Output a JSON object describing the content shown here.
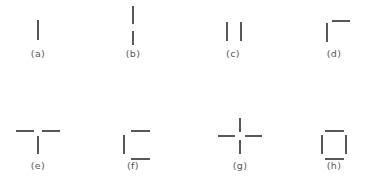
{
  "page": {
    "background_color": "#ffffff",
    "stroke_color": "#55585c",
    "label_color": "#55585c",
    "width": 366,
    "height": 185,
    "rows": 2,
    "columns": 4
  },
  "figures": [
    {
      "id": "a",
      "label": "(a)",
      "description": "single vertical stroke",
      "stroke_count": 1,
      "anchor": {
        "x": 38,
        "y": 20
      },
      "label_pos": {
        "x": 38,
        "y": 48
      },
      "strokes": [
        {
          "name": "vertical-stroke",
          "orientation": "vertical",
          "left": -1,
          "top": 0,
          "length": 20
        }
      ]
    },
    {
      "id": "b",
      "label": "(b)",
      "description": "two stacked vertical strokes",
      "stroke_count": 2,
      "anchor": {
        "x": 133,
        "y": 6
      },
      "label_pos": {
        "x": 133,
        "y": 48
      },
      "strokes": [
        {
          "name": "upper-vertical-stroke",
          "orientation": "vertical",
          "left": -1,
          "top": 0,
          "length": 18
        },
        {
          "name": "lower-vertical-stroke",
          "orientation": "vertical",
          "left": -1,
          "top": 25,
          "length": 14
        }
      ]
    },
    {
      "id": "c",
      "label": "(c)",
      "description": "two side-by-side vertical strokes",
      "stroke_count": 2,
      "anchor": {
        "x": 233,
        "y": 22
      },
      "label_pos": {
        "x": 233,
        "y": 48
      },
      "strokes": [
        {
          "name": "left-vertical-stroke",
          "orientation": "vertical",
          "left": -7,
          "top": 0,
          "length": 19
        },
        {
          "name": "right-vertical-stroke",
          "orientation": "vertical",
          "left": 7,
          "top": 0,
          "length": 19
        }
      ]
    },
    {
      "id": "d",
      "label": "(d)",
      "description": "vertical stroke with horizontal stroke at upper right",
      "stroke_count": 2,
      "anchor": {
        "x": 334,
        "y": 20
      },
      "label_pos": {
        "x": 334,
        "y": 48
      },
      "strokes": [
        {
          "name": "vertical-stroke",
          "orientation": "vertical",
          "left": -8,
          "top": 3,
          "length": 19
        },
        {
          "name": "top-horizontal-stroke",
          "orientation": "horizontal",
          "left": -2,
          "top": 0,
          "length": 18
        }
      ]
    },
    {
      "id": "e",
      "label": "(e)",
      "description": "T shape: two horizontal strokes with centre gap above a vertical stroke",
      "stroke_count": 3,
      "anchor": {
        "x": 38,
        "y": 130
      },
      "label_pos": {
        "x": 38,
        "y": 160
      },
      "strokes": [
        {
          "name": "left-horizontal-stroke",
          "orientation": "horizontal",
          "left": -22,
          "top": 0,
          "length": 18
        },
        {
          "name": "right-horizontal-stroke",
          "orientation": "horizontal",
          "left": 4,
          "top": 0,
          "length": 18
        },
        {
          "name": "vertical-stroke",
          "orientation": "vertical",
          "left": -1,
          "top": 6,
          "length": 18
        }
      ]
    },
    {
      "id": "f",
      "label": "(f)",
      "description": "C shape: left vertical stroke with top and bottom horizontal strokes",
      "stroke_count": 3,
      "anchor": {
        "x": 133,
        "y": 130
      },
      "label_pos": {
        "x": 133,
        "y": 160
      },
      "strokes": [
        {
          "name": "top-horizontal-stroke",
          "orientation": "horizontal",
          "left": -2,
          "top": 0,
          "length": 19
        },
        {
          "name": "left-vertical-stroke",
          "orientation": "vertical",
          "left": -10,
          "top": 5,
          "length": 19
        },
        {
          "name": "bottom-horizontal-stroke",
          "orientation": "horizontal",
          "left": -2,
          "top": 28,
          "length": 19
        }
      ]
    },
    {
      "id": "g",
      "label": "(g)",
      "description": "plus sign: four strokes radiating from a centre gap",
      "stroke_count": 4,
      "anchor": {
        "x": 240,
        "y": 136
      },
      "label_pos": {
        "x": 240,
        "y": 160
      },
      "strokes": [
        {
          "name": "top-vertical-stroke",
          "orientation": "vertical",
          "left": -1,
          "top": -18,
          "length": 14
        },
        {
          "name": "bottom-vertical-stroke",
          "orientation": "vertical",
          "left": -1,
          "top": 4,
          "length": 14
        },
        {
          "name": "left-horizontal-stroke",
          "orientation": "horizontal",
          "left": -22,
          "top": -1,
          "length": 17
        },
        {
          "name": "right-horizontal-stroke",
          "orientation": "horizontal",
          "left": 5,
          "top": -1,
          "length": 17
        }
      ]
    },
    {
      "id": "h",
      "label": "(h)",
      "description": "square outline made of four separate strokes with corner gaps",
      "stroke_count": 4,
      "anchor": {
        "x": 334,
        "y": 130
      },
      "label_pos": {
        "x": 334,
        "y": 160
      },
      "strokes": [
        {
          "name": "top-horizontal-stroke",
          "orientation": "horizontal",
          "left": -9,
          "top": 0,
          "length": 19
        },
        {
          "name": "left-vertical-stroke",
          "orientation": "vertical",
          "left": -13,
          "top": 5,
          "length": 19
        },
        {
          "name": "right-vertical-stroke",
          "orientation": "vertical",
          "left": 11,
          "top": 5,
          "length": 19
        },
        {
          "name": "bottom-horizontal-stroke",
          "orientation": "horizontal",
          "left": -9,
          "top": 28,
          "length": 19
        }
      ]
    }
  ]
}
